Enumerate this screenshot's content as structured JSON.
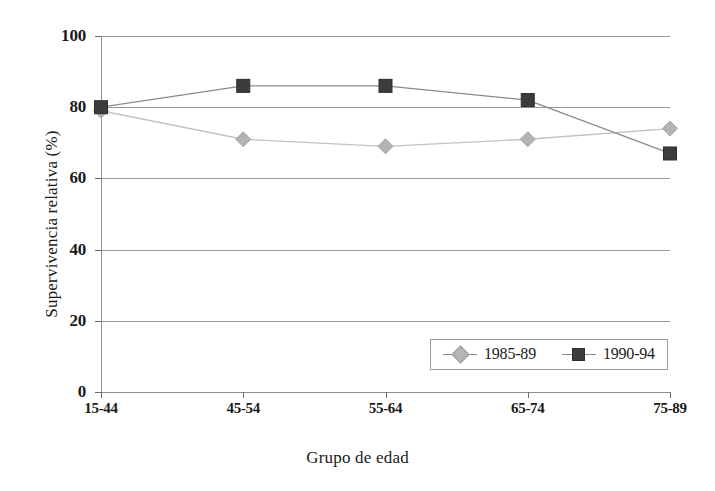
{
  "chart_data": {
    "type": "line",
    "title": "",
    "xlabel": "Grupo de edad",
    "ylabel": "Supervivencia relativa (%)",
    "categories": [
      "15-44",
      "45-54",
      "55-64",
      "65-74",
      "75-89"
    ],
    "ylim": [
      0,
      100
    ],
    "yticks": [
      0,
      20,
      40,
      60,
      80,
      100
    ],
    "ytick_labels": [
      "0",
      "20",
      "40",
      "60",
      "80",
      "100"
    ],
    "grid": true,
    "grid_axis": "y",
    "legend_position": "bottom-right-inside",
    "series": [
      {
        "name": "1985-89",
        "marker": "diamond",
        "color": "#b4b4b4",
        "line_color": "#c2c2c2",
        "values": [
          79,
          71,
          69,
          71,
          74
        ]
      },
      {
        "name": "1990-94",
        "marker": "square",
        "color": "#3c3c3c",
        "line_color": "#8a8a8a",
        "values": [
          80,
          86,
          86,
          82,
          67
        ]
      }
    ]
  },
  "legend": {
    "entries": [
      {
        "label": "1985-89"
      },
      {
        "label": "1990-94"
      }
    ]
  },
  "axis": {
    "x_title": "Grupo de edad",
    "y_title": "Supervivencia relativa (%)"
  },
  "colors": {
    "series_1985_89": "#b4b4b4",
    "series_1990_94": "#3c3c3c",
    "gridline": "#9a9a9a",
    "axis": "#8f8f8f",
    "background": "#ffffff",
    "text": "#1a1a1a"
  }
}
